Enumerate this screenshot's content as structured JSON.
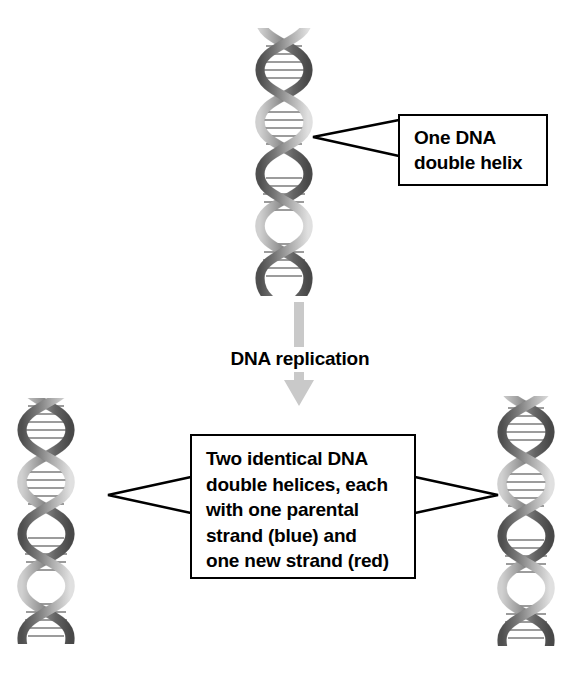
{
  "figure": {
    "background_color": "#ffffff",
    "line_color": "#000000",
    "arrow_color": "#c9c9c9",
    "helix_color": "#8c8c8c"
  },
  "callouts": [
    {
      "id": "one-dna-double-helix",
      "text": "One DNA\ndouble helix",
      "pointer": "left"
    },
    {
      "id": "two-identical-helices",
      "text": "Two identical DNA\ndouble helices, each\nwith one parental\nstrand (blue) and\none new strand (red)",
      "pointer": "both"
    }
  ],
  "process": {
    "label": "DNA replication",
    "arrow_direction": "down",
    "arrow_color": "#c9c9c9"
  },
  "helices": [
    {
      "id": "parent-helix",
      "position": "top-center",
      "role": "parental double helix"
    },
    {
      "id": "daughter-helix-left",
      "position": "bottom-left",
      "role": "daughter double helix"
    },
    {
      "id": "daughter-helix-right",
      "position": "bottom-right",
      "role": "daughter double helix"
    }
  ],
  "legend_terms": {
    "parental_strand_color_word": "blue",
    "new_strand_color_word": "red"
  }
}
